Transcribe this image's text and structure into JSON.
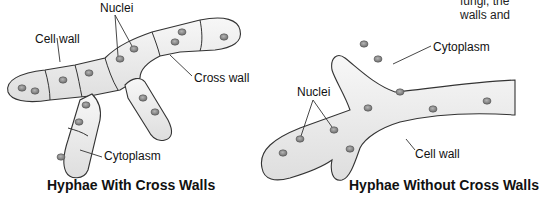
{
  "corner_text": {
    "line1": "fungi, the",
    "line2": "walls and"
  },
  "left_diagram": {
    "title": "Hyphae With Cross Walls",
    "labels": {
      "nuclei": "Nuclei",
      "cell_wall": "Cell wall",
      "cross_wall": "Cross wall",
      "cytoplasm": "Cytoplasm"
    }
  },
  "right_diagram": {
    "title": "Hyphae Without Cross Walls",
    "labels": {
      "cytoplasm": "Cytoplasm",
      "nuclei": "Nuclei",
      "cell_wall": "Cell wall"
    }
  },
  "colors": {
    "hypha_fill": "#ececec",
    "outline": "#333333",
    "nucleus": "#8a8a8a"
  }
}
